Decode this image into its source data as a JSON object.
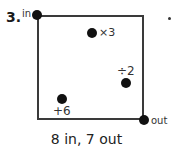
{
  "problem": {
    "number": "3.",
    "entry_label": "in",
    "exit_label": "out",
    "operations": [
      {
        "label": "×3"
      },
      {
        "label": "÷2"
      },
      {
        "label": "+6"
      }
    ],
    "caption": "8 in, 7 out"
  }
}
